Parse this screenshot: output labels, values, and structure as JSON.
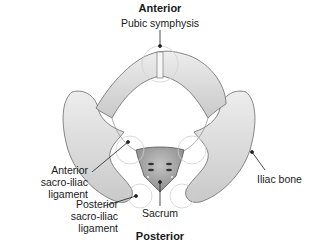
{
  "diagram": {
    "title_top": "Anterior",
    "title_bottom": "Posterior",
    "labels": {
      "pubic_symphysis": "Pubic symphysis",
      "anterior_si_line1": "Anterior",
      "anterior_si_line2": "sacro-iliac",
      "anterior_si_line3": "ligament",
      "posterior_si_line1": "Posterior",
      "posterior_si_line2": "sacro-iliac",
      "posterior_si_line3": "ligament",
      "sacrum": "Sacrum",
      "iliac_bone": "Iliac bone"
    },
    "colors": {
      "bone_fill": "#e2e2e2",
      "bone_shadow": "#b8b8b8",
      "bone_outline": "#6a6a6a",
      "sacrum_fill": "#a9a9a9",
      "leader_line": "#222222",
      "joint_circle": "#bdbdbd"
    }
  }
}
